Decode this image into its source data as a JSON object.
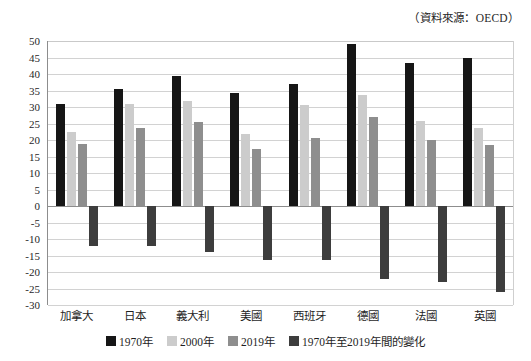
{
  "source_note": "（資料來源：OECD）",
  "chart_data": {
    "type": "bar",
    "title": "",
    "subtitle": "",
    "xlabel": "",
    "ylabel": "",
    "ylim": [
      -30,
      50
    ],
    "ytick_step": 5,
    "yticks": [
      50,
      45,
      40,
      35,
      30,
      25,
      20,
      15,
      10,
      5,
      0,
      -5,
      -10,
      -15,
      -20,
      -25,
      -30
    ],
    "ytick_labels": [
      "50",
      "45",
      "40",
      "35",
      "30",
      "25",
      "20",
      "15",
      "10",
      "5",
      "0",
      "-5",
      "-10",
      "-15",
      "-20",
      "-25",
      "-30"
    ],
    "grid": true,
    "legend_position": "bottom",
    "categories": [
      "加拿大",
      "日本",
      "義大利",
      "美國",
      "西班牙",
      "德國",
      "法國",
      "英國"
    ],
    "series": [
      {
        "name": "1970年",
        "color": "#161616",
        "values": [
          30.8,
          35.6,
          39.4,
          34.2,
          37.0,
          49.1,
          43.2,
          44.7
        ]
      },
      {
        "name": "2000年",
        "color": "#cccccc",
        "values": [
          22.3,
          30.9,
          31.8,
          21.8,
          30.6,
          33.5,
          25.8,
          23.6
        ]
      },
      {
        "name": "2019年",
        "color": "#8e8e8e",
        "values": [
          18.8,
          23.6,
          25.5,
          17.4,
          20.6,
          27.1,
          20.1,
          18.5
        ]
      },
      {
        "name": "1970年至2019年間的變化",
        "color": "#3d3d3d",
        "values": [
          -12.0,
          -12.1,
          -13.9,
          -16.4,
          -16.5,
          -22.0,
          -23.0,
          -26.2
        ]
      }
    ]
  }
}
